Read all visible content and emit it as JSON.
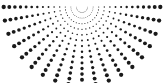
{
  "figure": {
    "width": 163,
    "height": 83,
    "background_color": "#ffffff",
    "dot_color": "#1a1a1a"
  },
  "chart_data": {
    "type": "scatter",
    "subtitle": "",
    "xlabel": "",
    "ylabel": "",
    "grid": false,
    "legend_position": "none",
    "xlim": [
      0,
      163
    ],
    "ylim": [
      0,
      83
    ],
    "annotations": [],
    "tick_labels": {
      "x": [],
      "y": []
    },
    "legend_entries": [],
    "pattern": {
      "kind": "polar-dot-array",
      "center_x": 82,
      "center_y": 7,
      "angle_start_deg": 0,
      "angle_end_deg": 180,
      "ray_count": 19,
      "angle_step_deg": 10,
      "ring_count": 14,
      "ring_radius_min": 5.5,
      "ring_radius_step": 5.6,
      "dot_radius_min": 0.32,
      "dot_radius_max": 2.15,
      "dot_color": "#1a1a1a"
    },
    "angles_deg": [
      0,
      10,
      20,
      30,
      40,
      50,
      60,
      70,
      80,
      90,
      100,
      110,
      120,
      130,
      140,
      150,
      160,
      170,
      180
    ],
    "ring_radii": [
      5.5,
      11.1,
      16.7,
      22.3,
      27.9,
      33.5,
      39.1,
      44.7,
      50.3,
      55.9,
      61.5,
      67.1,
      72.7,
      78.3
    ],
    "ring_dot_radii": [
      0.32,
      0.42,
      0.54,
      0.66,
      0.79,
      0.92,
      1.05,
      1.2,
      1.34,
      1.49,
      1.64,
      1.79,
      1.96,
      2.15
    ]
  }
}
